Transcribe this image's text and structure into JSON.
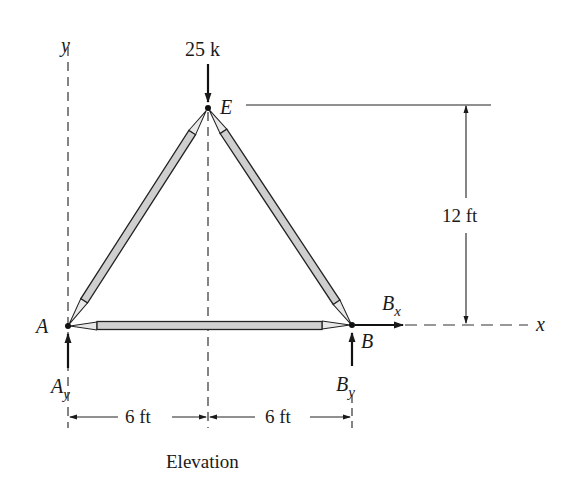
{
  "figure": {
    "type": "truss_elevation",
    "caption": "Elevation",
    "axes": {
      "y_label": "y",
      "x_label": "x"
    },
    "joints": [
      {
        "id": "A",
        "label": "A"
      },
      {
        "id": "B",
        "label": "B"
      },
      {
        "id": "E",
        "label": "E"
      }
    ],
    "members": [
      {
        "from": "A",
        "to": "E"
      },
      {
        "from": "E",
        "to": "B"
      },
      {
        "from": "A",
        "to": "B"
      }
    ],
    "loads": [
      {
        "at": "E",
        "label": "25 k",
        "direction": "down"
      }
    ],
    "reactions": [
      {
        "at": "A",
        "label_main": "A",
        "label_sub": "y",
        "direction": "up"
      },
      {
        "at": "B",
        "label_main": "B",
        "label_sub": "y",
        "direction": "up"
      },
      {
        "at": "B",
        "label_main": "B",
        "label_sub": "x",
        "direction": "right"
      }
    ],
    "dimensions": {
      "height": "12 ft",
      "left_span": "6 ft",
      "right_span": "6 ft"
    }
  }
}
